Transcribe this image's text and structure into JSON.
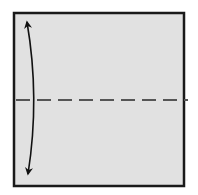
{
  "diagram": {
    "type": "origami-step",
    "paper": {
      "x": 14,
      "y": 13,
      "width": 170,
      "height": 173,
      "fill": "#e1e1e1",
      "stroke": "#1a1a1a",
      "stroke_width": 2.5
    },
    "fold_line": {
      "kind": "valley-fold",
      "y": 100,
      "x1": 16,
      "x2": 188,
      "color": "#555555",
      "dash": "14 7",
      "stroke_width": 2
    },
    "fold_arrow": {
      "kind": "two-way-arrow",
      "start": [
        27,
        22
      ],
      "control": [
        40,
        98
      ],
      "end": [
        28,
        174
      ],
      "color": "#111111"
    }
  }
}
